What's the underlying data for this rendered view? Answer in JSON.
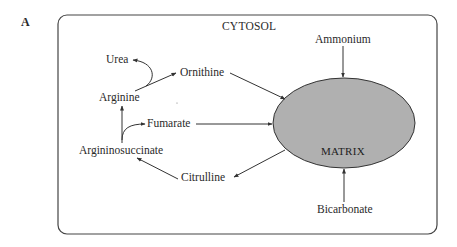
{
  "figure": {
    "panel_letter": "A",
    "compartments": {
      "outer": "CYTOSOL",
      "inner": "MATRIX"
    },
    "metabolites": {
      "urea": "Urea",
      "ornithine": "Ornithine",
      "arginine": "Arginine",
      "fumarate": "Fumarate",
      "argininosuccinate": "Argininosuccinate",
      "citrulline": "Citrulline",
      "ammonium": "Ammonium",
      "bicarbonate": "Bicarbonate"
    },
    "colors": {
      "matrix_fill": "#b0b0b0",
      "stroke": "#333333",
      "background": "#ffffff"
    },
    "edges": [
      {
        "from": "Arginine",
        "to": "Urea",
        "type": "curved"
      },
      {
        "from": "Arginine",
        "to": "Ornithine",
        "type": "straight"
      },
      {
        "from": "Ornithine",
        "to": "MATRIX",
        "type": "straight"
      },
      {
        "from": "Argininosuccinate",
        "to": "Arginine",
        "type": "straight"
      },
      {
        "from": "Argininosuccinate",
        "to": "Fumarate",
        "type": "curved"
      },
      {
        "from": "Fumarate",
        "to": "MATRIX",
        "type": "straight"
      },
      {
        "from": "MATRIX",
        "to": "Citrulline",
        "type": "straight"
      },
      {
        "from": "Citrulline",
        "to": "Argininosuccinate",
        "type": "straight"
      },
      {
        "from": "Ammonium",
        "to": "MATRIX",
        "type": "straight"
      },
      {
        "from": "Bicarbonate",
        "to": "MATRIX",
        "type": "straight"
      }
    ]
  }
}
